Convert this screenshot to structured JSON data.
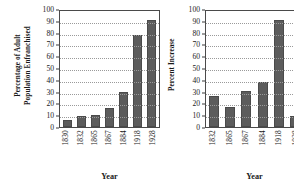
{
  "chart_data": [
    {
      "type": "bar",
      "title": "",
      "xlabel": "Year",
      "ylabel": "Percentage of Adult Population Enfranchised",
      "ylabel_line1": "Percentage of Adult",
      "ylabel_line2": "Population Enfranchised",
      "categories": [
        "1830",
        "1832",
        "1865",
        "1867",
        "1884",
        "1918",
        "1928"
      ],
      "values": [
        6,
        9.5,
        10.5,
        16.5,
        29.5,
        78,
        90.5
      ],
      "ylim": [
        0,
        100
      ],
      "yticks": [
        0,
        10,
        20,
        30,
        40,
        50,
        60,
        70,
        80,
        90,
        100
      ],
      "grid": true,
      "legend": "none",
      "bar_color": "#5c5c5c",
      "bar_edge_color": "#4a4a4a"
    },
    {
      "type": "bar",
      "title": "",
      "xlabel": "Year",
      "ylabel": "Percent Increase",
      "ylabel_line1": "Percent Increase",
      "ylabel_line2": "",
      "categories": [
        "1832",
        "1865",
        "1867",
        "1884",
        "1918",
        "1928"
      ],
      "values": [
        26,
        17,
        30.5,
        38.5,
        90.5,
        9
      ],
      "ylim": [
        0,
        100
      ],
      "yticks": [
        0,
        10,
        20,
        30,
        40,
        50,
        60,
        70,
        80,
        90,
        100
      ],
      "grid": true,
      "legend": "none",
      "bar_color": "#5c5c5c",
      "bar_edge_color": "#4a4a4a"
    }
  ]
}
